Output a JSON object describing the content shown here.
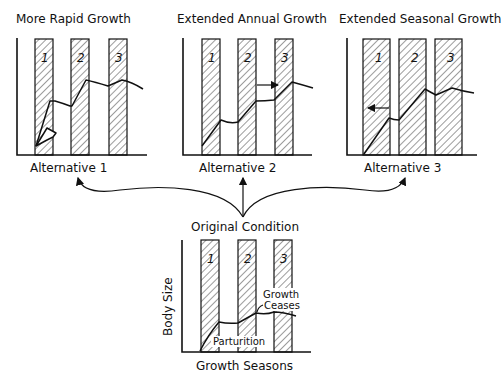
{
  "panels": [
    {
      "id": "alt1",
      "title": "More Rapid Growth",
      "caption": "Alternative 1",
      "season_labels": [
        "1",
        "2",
        "3"
      ]
    },
    {
      "id": "alt2",
      "title": "Extended Annual Growth",
      "caption": "Alternative 2",
      "season_labels": [
        "1",
        "2",
        "3"
      ]
    },
    {
      "id": "alt3",
      "title": "Extended Seasonal Growth",
      "caption": "Alternative 3",
      "season_labels": [
        "1",
        "2",
        "3"
      ]
    }
  ],
  "original": {
    "title": "Original Condition",
    "y_axis_label": "Body Size",
    "x_axis_label": "Growth Seasons",
    "season_labels": [
      "1",
      "2",
      "3"
    ],
    "annotations": {
      "growth_ceases_line1": "Growth",
      "growth_ceases_line2": "Ceases",
      "parturition": "Parturition"
    }
  },
  "colors": {
    "ink": "#111111",
    "background": "#ffffff"
  }
}
